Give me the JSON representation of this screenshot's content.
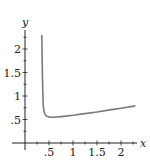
{
  "chart_data": {
    "type": "line",
    "title": "",
    "xlabel": "x",
    "ylabel": "y",
    "xlim": [
      0,
      2.3
    ],
    "ylim": [
      0,
      2.35
    ],
    "grid": false,
    "legend": null,
    "x_ticks": [
      0.5,
      1,
      1.5,
      2
    ],
    "x_tick_labels": [
      ".5",
      "1",
      "1.5",
      "2"
    ],
    "y_ticks": [
      0.5,
      1,
      1.5,
      2
    ],
    "y_tick_labels": [
      ".5",
      "1",
      "1.5",
      "2"
    ],
    "series": [
      {
        "name": "curve",
        "color": "#7a7a7a",
        "x": [
          0.35,
          0.36,
          0.37,
          0.38,
          0.4,
          0.42,
          0.45,
          0.5,
          0.55,
          0.6,
          0.7,
          0.8,
          1.0,
          1.2,
          1.5,
          1.8,
          2.0,
          2.3
        ],
        "y": [
          2.3,
          1.6,
          1.1,
          0.8,
          0.65,
          0.6,
          0.57,
          0.555,
          0.55,
          0.55,
          0.555,
          0.565,
          0.59,
          0.62,
          0.66,
          0.71,
          0.74,
          0.79
        ]
      }
    ]
  }
}
